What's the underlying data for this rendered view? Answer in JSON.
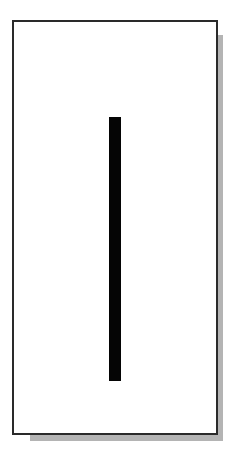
{
  "figure": {
    "frame": {
      "border_color": "#2a2a2a",
      "fill_color": "#ffffff",
      "shadow_color": "#b4b4b4"
    },
    "bar": {
      "orientation": "vertical",
      "color": "#050505"
    }
  }
}
